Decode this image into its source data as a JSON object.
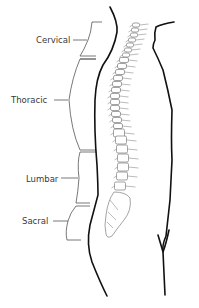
{
  "diagram": {
    "regions": [
      {
        "id": "cervical",
        "label": "Cervical"
      },
      {
        "id": "thoracic",
        "label": "Thoracic"
      },
      {
        "id": "lumbar",
        "label": "Lumbar"
      },
      {
        "id": "sacral",
        "label": "Sacral"
      }
    ],
    "colors": {
      "outline": "#111111",
      "label_text": "#3a3a3a",
      "bracket": "#555555",
      "vertebra_stroke": "#666666",
      "background": "#ffffff"
    }
  }
}
